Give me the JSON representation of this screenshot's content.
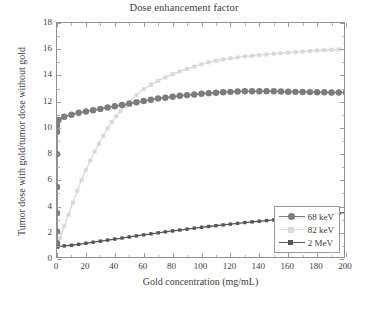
{
  "chart_data": {
    "type": "line",
    "title": "Dose enhancement factor",
    "xlabel": "Gold concentration (mg/mL)",
    "ylabel": "Tumor dose with gold/tumor dose without gold",
    "xlim": [
      0,
      200
    ],
    "ylim": [
      0,
      18
    ],
    "xticks": [
      0,
      20,
      40,
      60,
      80,
      100,
      120,
      140,
      160,
      180,
      200
    ],
    "yticks": [
      0,
      2,
      4,
      6,
      8,
      10,
      12,
      14,
      16,
      18
    ],
    "grid": false,
    "legend_position": "lower right",
    "series": [
      {
        "name": "68 keV",
        "color": "#7c7c7c",
        "marker": "circle",
        "x": [
          0,
          0,
          0,
          0,
          0,
          0,
          0,
          0,
          1,
          5,
          10,
          15,
          20,
          25,
          30,
          35,
          40,
          45,
          50,
          55,
          60,
          65,
          70,
          75,
          80,
          85,
          90,
          95,
          100,
          105,
          110,
          115,
          120,
          125,
          130,
          135,
          140,
          145,
          150,
          155,
          160,
          165,
          170,
          175,
          180,
          185,
          190,
          195,
          200
        ],
        "y": [
          1.0,
          1.2,
          2.1,
          3.5,
          5.5,
          8.0,
          9.7,
          10.2,
          10.6,
          10.85,
          11.0,
          11.15,
          11.25,
          11.35,
          11.45,
          11.55,
          11.65,
          11.75,
          11.85,
          11.95,
          12.05,
          12.15,
          12.25,
          12.3,
          12.38,
          12.45,
          12.5,
          12.55,
          12.6,
          12.65,
          12.68,
          12.72,
          12.75,
          12.77,
          12.8,
          12.8,
          12.8,
          12.8,
          12.8,
          12.78,
          12.76,
          12.75,
          12.74,
          12.73,
          12.72,
          12.72,
          12.7,
          12.7,
          12.7
        ]
      },
      {
        "name": "82 keV",
        "color": "#d9d9d9",
        "marker": "square",
        "x": [
          0,
          2,
          5,
          8,
          11,
          14,
          17,
          20,
          23,
          26,
          29,
          32,
          35,
          38,
          41,
          44,
          47,
          50,
          55,
          60,
          65,
          70,
          75,
          80,
          85,
          90,
          95,
          100,
          105,
          110,
          115,
          120,
          125,
          130,
          135,
          140,
          145,
          150,
          155,
          160,
          165,
          170,
          175,
          180,
          185,
          190,
          195,
          200
        ],
        "y": [
          1.0,
          1.6,
          2.5,
          3.4,
          4.3,
          5.2,
          6.0,
          6.8,
          7.5,
          8.2,
          8.8,
          9.4,
          9.95,
          10.45,
          10.9,
          11.3,
          11.65,
          12.0,
          12.5,
          12.95,
          13.3,
          13.6,
          13.85,
          14.1,
          14.3,
          14.5,
          14.68,
          14.85,
          15.0,
          15.12,
          15.22,
          15.3,
          15.38,
          15.45,
          15.5,
          15.55,
          15.6,
          15.65,
          15.7,
          15.75,
          15.78,
          15.82,
          15.86,
          15.9,
          15.93,
          15.96,
          15.98,
          16.0
        ]
      },
      {
        "name": "2 MeV",
        "color": "#555555",
        "marker": "square",
        "x": [
          0,
          5,
          10,
          15,
          20,
          25,
          30,
          35,
          40,
          45,
          50,
          55,
          60,
          65,
          70,
          75,
          80,
          85,
          90,
          95,
          100,
          105,
          110,
          115,
          120,
          125,
          130,
          135,
          140,
          145,
          150,
          155,
          160,
          165,
          170,
          175,
          180,
          185,
          190,
          195,
          200
        ],
        "y": [
          0.95,
          1.0,
          1.05,
          1.12,
          1.2,
          1.28,
          1.36,
          1.44,
          1.52,
          1.6,
          1.68,
          1.76,
          1.84,
          1.92,
          2.0,
          2.07,
          2.14,
          2.21,
          2.28,
          2.35,
          2.42,
          2.48,
          2.54,
          2.6,
          2.66,
          2.72,
          2.78,
          2.83,
          2.88,
          2.93,
          2.98,
          3.03,
          3.08,
          3.13,
          3.18,
          3.24,
          3.3,
          3.36,
          3.42,
          3.48,
          3.55
        ]
      }
    ]
  },
  "legend": {
    "items": [
      {
        "label": "68 keV"
      },
      {
        "label": "82 keV"
      },
      {
        "label": "2 MeV"
      }
    ]
  }
}
